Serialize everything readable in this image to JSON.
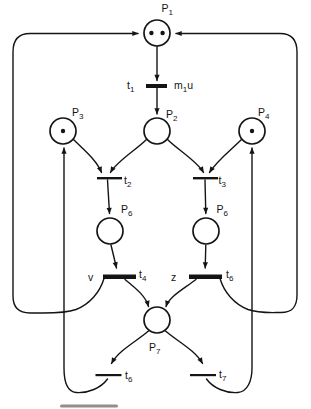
{
  "diagram": {
    "kind": "petri-net",
    "background_color": "#ffffff",
    "ink_color": "#141414",
    "places": [
      {
        "id": "P1",
        "label": {
          "base": "P",
          "sub": "1"
        },
        "tokens": 2
      },
      {
        "id": "P2",
        "label": {
          "base": "P",
          "sub": "2"
        },
        "tokens": 0
      },
      {
        "id": "P3",
        "label": {
          "base": "P",
          "sub": "3"
        },
        "tokens": 1
      },
      {
        "id": "P4",
        "label": {
          "base": "P",
          "sub": "4"
        },
        "tokens": 1
      },
      {
        "id": "P6-left",
        "label": {
          "base": "P",
          "sub": "6"
        },
        "tokens": 0
      },
      {
        "id": "P6-right",
        "label": {
          "base": "P",
          "sub": "6"
        },
        "tokens": 0
      },
      {
        "id": "P7",
        "label": {
          "base": "P",
          "sub": "7"
        },
        "tokens": 0
      }
    ],
    "transitions": [
      {
        "id": "t1",
        "label": {
          "base": "t",
          "sub": "1"
        },
        "thick": true,
        "control": {
          "base": "m",
          "sub": "1",
          "tail": "u"
        }
      },
      {
        "id": "t2",
        "label": {
          "base": "t",
          "sub": "2"
        },
        "thick": false
      },
      {
        "id": "t3",
        "label": {
          "base": "t",
          "sub": "3"
        },
        "thick": false
      },
      {
        "id": "t4",
        "label": {
          "base": "t",
          "sub": "4"
        },
        "thick": true,
        "control": "v"
      },
      {
        "id": "t5-printed-t6",
        "label": {
          "base": "t",
          "sub": "6"
        },
        "thick": true,
        "control": "z"
      },
      {
        "id": "t6",
        "label": {
          "base": "t",
          "sub": "6"
        },
        "thick": false
      },
      {
        "id": "t7",
        "label": {
          "base": "t",
          "sub": "7"
        },
        "thick": false
      }
    ],
    "arcs": [
      {
        "from": "P1",
        "to": "t1"
      },
      {
        "from": "t1",
        "to": "P2"
      },
      {
        "from": "P2",
        "to": "t2"
      },
      {
        "from": "P3",
        "to": "t2"
      },
      {
        "from": "P2",
        "to": "t3"
      },
      {
        "from": "P4",
        "to": "t3"
      },
      {
        "from": "t2",
        "to": "P6-left"
      },
      {
        "from": "P6-left",
        "to": "t4"
      },
      {
        "from": "t3",
        "to": "P6-right"
      },
      {
        "from": "P6-right",
        "to": "t5-printed-t6"
      },
      {
        "from": "t4",
        "to": "P7"
      },
      {
        "from": "t5-printed-t6",
        "to": "P7"
      },
      {
        "from": "t4",
        "to": "P1"
      },
      {
        "from": "t5-printed-t6",
        "to": "P1"
      },
      {
        "from": "P7",
        "to": "t6"
      },
      {
        "from": "t6",
        "to": "P3"
      },
      {
        "from": "P7",
        "to": "t7"
      },
      {
        "from": "t7",
        "to": "P4"
      }
    ]
  }
}
